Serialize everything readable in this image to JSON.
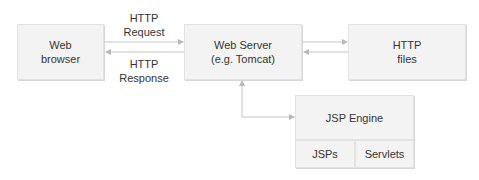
{
  "diagram": {
    "nodes": {
      "browser": {
        "line1": "Web",
        "line2": "browser"
      },
      "server": {
        "line1": "Web Server",
        "line2": "(e.g. Tomcat)"
      },
      "files": {
        "line1": "HTTP",
        "line2": "files"
      },
      "jsp_engine": {
        "label": "JSP Engine"
      },
      "jsps": {
        "label": "JSPs"
      },
      "servlets": {
        "label": "Servlets"
      }
    },
    "edges": {
      "request": {
        "line1": "HTTP",
        "line2": "Request"
      },
      "response": {
        "line1": "HTTP",
        "line2": "Response"
      }
    },
    "colors": {
      "box_fill": "#f3f3f3",
      "box_border": "#e2e2e2",
      "arrow": "#b8b8b8",
      "text": "#333333"
    }
  }
}
